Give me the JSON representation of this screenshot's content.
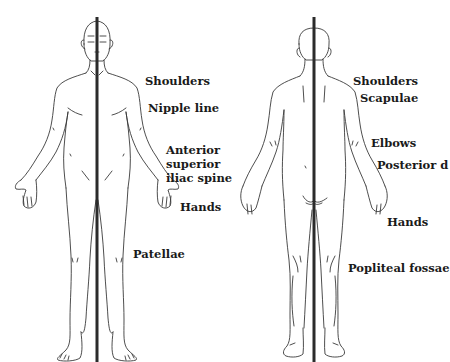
{
  "diagram": {
    "line_color": "#2b2b2b",
    "outline_color": "#3a3a3a",
    "text_color": "#1a1a1a",
    "anterior_view": {
      "labels": [
        {
          "id": "shoulders",
          "text": "Shoulders"
        },
        {
          "id": "nipple_line",
          "text": "Nipple line"
        },
        {
          "id": "asis_1",
          "text": "Anterior"
        },
        {
          "id": "asis_2",
          "text": "superior"
        },
        {
          "id": "asis_3",
          "text": "iliac spine"
        },
        {
          "id": "hands",
          "text": "Hands"
        },
        {
          "id": "patellae",
          "text": "Patellae"
        }
      ]
    },
    "posterior_view": {
      "labels": [
        {
          "id": "shoulders",
          "text": "Shoulders"
        },
        {
          "id": "scapulae",
          "text": "Scapulae"
        },
        {
          "id": "elbows",
          "text": "Elbows"
        },
        {
          "id": "posterior_d",
          "text": "Posterior d"
        },
        {
          "id": "hands",
          "text": "Hands"
        },
        {
          "id": "popliteal_fossae",
          "text": "Popliteal fossae"
        }
      ]
    }
  }
}
